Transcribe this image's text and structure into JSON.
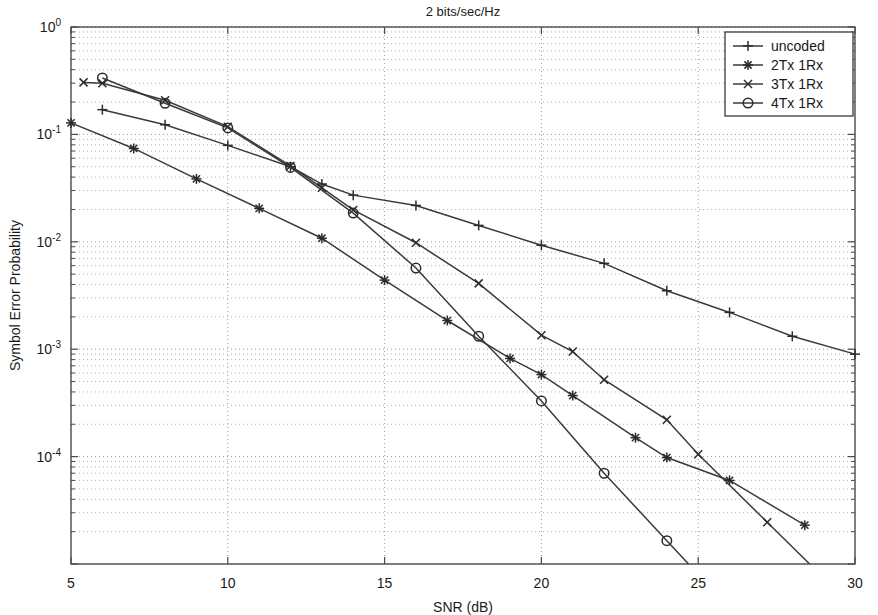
{
  "chart_data": {
    "type": "line",
    "title": "2 bits/sec/Hz",
    "xlabel": "SNR (dB)",
    "ylabel": "Symbol Error Probability",
    "xlim": [
      5,
      30
    ],
    "ylim": [
      1e-05,
      1
    ],
    "yscale": "log",
    "xticks": [
      5,
      10,
      15,
      20,
      25,
      30
    ],
    "xticklabels": [
      "5",
      "10",
      "15",
      "20",
      "25",
      "30"
    ],
    "yticks": [
      1,
      0.1,
      0.01,
      0.001,
      0.0001
    ],
    "yticklabels": [
      "10^0",
      "10^-1",
      "10^-2",
      "10^-3",
      "10^-4"
    ],
    "grid": true,
    "grid_style": "dotted",
    "legend_position": "upper right",
    "series": [
      {
        "name": "uncoded",
        "marker": "plus",
        "x": [
          6,
          8,
          10,
          12,
          13,
          14,
          16,
          18,
          20,
          22,
          24,
          26,
          28,
          30
        ],
        "y": [
          0.17,
          0.123,
          0.079,
          0.05,
          0.0345,
          0.0272,
          0.0218,
          0.0142,
          0.0093,
          0.0063,
          0.0035,
          0.0022,
          0.00132,
          0.0009
        ]
      },
      {
        "name": "2Tx 1Rx",
        "marker": "asterisk",
        "x": [
          5,
          7,
          9,
          11,
          13,
          15,
          17,
          19,
          20,
          21,
          23,
          24,
          26,
          28.4
        ],
        "y": [
          0.128,
          0.074,
          0.0385,
          0.0205,
          0.0108,
          0.0044,
          0.00185,
          0.00082,
          0.00058,
          0.00037,
          0.00015,
          9.8e-05,
          6e-05,
          2.3e-05
        ]
      },
      {
        "name": "3Tx 1Rx",
        "marker": "cross",
        "x": [
          5.4,
          6,
          8,
          10,
          12,
          13,
          14,
          16,
          18,
          20,
          21,
          22,
          24,
          25,
          27.2
        ],
        "y": [
          0.305,
          0.3,
          0.208,
          0.118,
          0.0508,
          0.0318,
          0.0198,
          0.0098,
          0.0041,
          0.00135,
          0.00095,
          0.00052,
          0.00022,
          0.000105,
          2.45e-05
        ]
      },
      {
        "name": "4Tx 1Rx",
        "marker": "circle",
        "x": [
          6,
          8,
          10,
          12,
          14,
          16,
          18,
          20,
          22,
          24
        ],
        "y": [
          0.335,
          0.195,
          0.115,
          0.0492,
          0.0185,
          0.0057,
          0.00132,
          0.00033,
          7e-05,
          1.65e-05
        ]
      }
    ]
  },
  "legend": {
    "entries": [
      {
        "label": "uncoded",
        "marker": "plus"
      },
      {
        "label": "2Tx 1Rx",
        "marker": "asterisk"
      },
      {
        "label": "3Tx 1Rx",
        "marker": "cross"
      },
      {
        "label": "4Tx 1Rx",
        "marker": "circle"
      }
    ]
  },
  "colors": {
    "line": "#3a3a3a",
    "axis": "#4a4a4a",
    "grid": "#9a9a9a",
    "text": "#1a1a1a",
    "background": "#ffffff"
  }
}
